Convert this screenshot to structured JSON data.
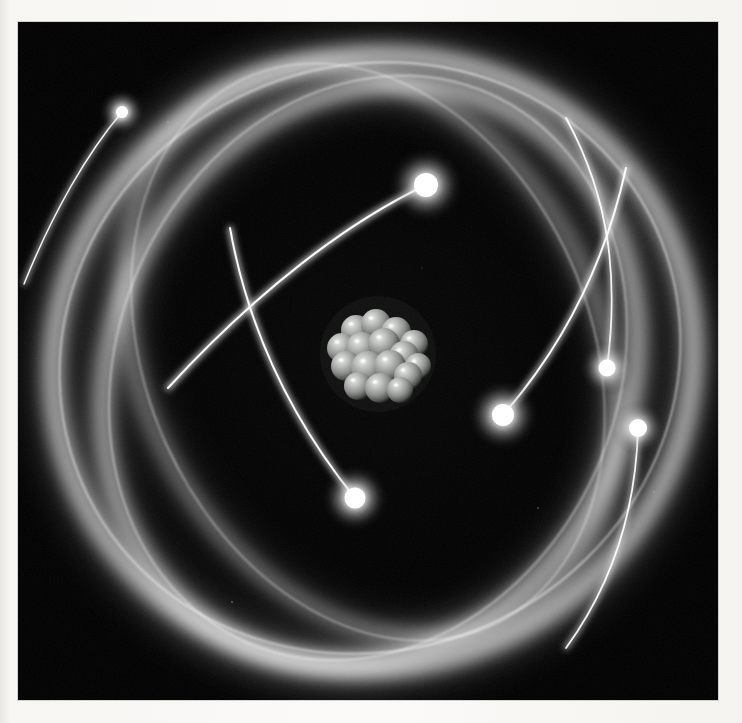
{
  "scene": {
    "title": "Atom illustration",
    "subject": "atomic model with nucleus and orbiting electrons",
    "background_color": "#000000",
    "border_color": "#f7f6f3",
    "glow_color": "#ffffff",
    "photo": {
      "x": 18,
      "y": 22,
      "width": 700,
      "height": 678
    }
  },
  "nucleus": {
    "label": "nucleus",
    "center_x": 360,
    "center_y": 332,
    "radius": 44,
    "sphere_color": "#b9bbb8",
    "sphere_shadow": "#2e302e",
    "highlight_color": "#ffffff",
    "particle_count": 16,
    "particles": [
      {
        "cx": -22,
        "cy": -24,
        "r": 15
      },
      {
        "cx": -2,
        "cy": -30,
        "r": 15
      },
      {
        "cx": 18,
        "cy": -22,
        "r": 15
      },
      {
        "cx": 36,
        "cy": -10,
        "r": 14
      },
      {
        "cx": -36,
        "cy": -6,
        "r": 15
      },
      {
        "cx": -16,
        "cy": -6,
        "r": 16
      },
      {
        "cx": 6,
        "cy": -10,
        "r": 16
      },
      {
        "cx": 26,
        "cy": 2,
        "r": 15
      },
      {
        "cx": 40,
        "cy": 12,
        "r": 13
      },
      {
        "cx": -32,
        "cy": 12,
        "r": 15
      },
      {
        "cx": -10,
        "cy": 14,
        "r": 17
      },
      {
        "cx": 12,
        "cy": 12,
        "r": 16
      },
      {
        "cx": 30,
        "cy": 22,
        "r": 14
      },
      {
        "cx": -20,
        "cy": 32,
        "r": 14
      },
      {
        "cx": 2,
        "cy": 34,
        "r": 15
      },
      {
        "cx": 22,
        "cy": 36,
        "r": 13
      }
    ]
  },
  "orbits": [
    {
      "name": "orbit-band-outer",
      "cx": 355,
      "cy": 340,
      "rx": 322,
      "ry": 305,
      "rotation": -18,
      "band_width": 22,
      "opacity": 0.78
    },
    {
      "name": "orbit-band-middle",
      "cx": 352,
      "cy": 352,
      "rx": 258,
      "ry": 298,
      "rotation": 28,
      "band_width": 19,
      "opacity": 0.72
    },
    {
      "name": "orbit-band-inner",
      "cx": 352,
      "cy": 330,
      "rx": 300,
      "ry": 228,
      "rotation": 62,
      "band_width": 17,
      "opacity": 0.62
    }
  ],
  "thin_paths": [
    {
      "name": "thin-orbit-1",
      "cx": 352,
      "cy": 336,
      "rx": 314,
      "ry": 292,
      "rotation": -24
    },
    {
      "name": "thin-orbit-2",
      "cx": 350,
      "cy": 346,
      "rx": 250,
      "ry": 300,
      "rotation": 24
    },
    {
      "name": "thin-orbit-3",
      "cx": 350,
      "cy": 330,
      "rx": 300,
      "ry": 222,
      "rotation": 66
    }
  ],
  "electrons": [
    {
      "name": "electron-top-left",
      "x": 104,
      "y": 90,
      "r": 7,
      "trail_angle": 215,
      "trail_length": 150,
      "brightness": 1.0
    },
    {
      "name": "electron-upper-center",
      "x": 408,
      "y": 163,
      "r": 10,
      "trail_angle": 200,
      "trail_length": 235,
      "brightness": 1.0
    },
    {
      "name": "electron-right-upper",
      "x": 589,
      "y": 346,
      "r": 9,
      "trail_angle": 80,
      "trail_length": 210,
      "brightness": 0.95
    },
    {
      "name": "electron-right-lower",
      "x": 485,
      "y": 393,
      "r": 10,
      "trail_angle": 38,
      "trail_length": 245,
      "brightness": 1.0
    },
    {
      "name": "electron-bottom-center",
      "x": 337,
      "y": 476,
      "r": 10,
      "trail_angle": 305,
      "trail_length": 265,
      "brightness": 1.0
    },
    {
      "name": "electron-far-right",
      "x": 620,
      "y": 406,
      "r": 9,
      "trail_angle": 100,
      "trail_length": 230,
      "brightness": 0.95
    }
  ]
}
